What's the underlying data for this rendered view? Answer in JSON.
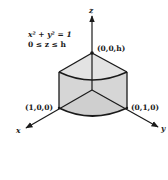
{
  "figure": {
    "equation_line1": "x² + y² = 1",
    "equation_line2": "0 ≤ z ≤ h",
    "axes": {
      "x_label": "x",
      "y_label": "y",
      "z_label": "z"
    },
    "points": {
      "top": "(0,0,h)",
      "x_intercept": "(1,0,0)",
      "y_intercept": "(0,1,0)"
    },
    "colors": {
      "stroke": "#1a1a1a",
      "fill": "#d9d9d9",
      "background": "#ffffff"
    }
  }
}
